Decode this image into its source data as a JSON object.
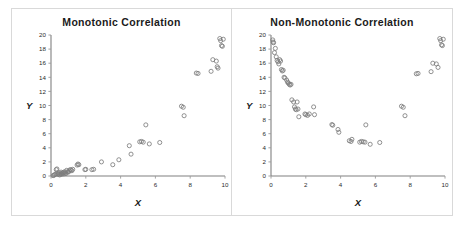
{
  "figure": {
    "background_color": "#ffffff",
    "frame_color": "#d9d9d9",
    "marker_color": "#7d7d7d",
    "axis_color": "#808080"
  },
  "panels": [
    {
      "id": "monotonic",
      "title": "Monotonic  Correlation",
      "xlabel": "X",
      "ylabel": "Y"
    },
    {
      "id": "non-monotonic",
      "title": "Non-Monotonic Correlation",
      "xlabel": "X",
      "ylabel": "Y"
    }
  ],
  "chart_data": [
    {
      "type": "scatter",
      "title": "Monotonic  Correlation",
      "xlabel": "X",
      "ylabel": "Y",
      "xlim": [
        0,
        10
      ],
      "ylim": [
        0,
        20
      ],
      "xticks": [
        0,
        2,
        4,
        6,
        8,
        10
      ],
      "yticks": [
        0,
        2,
        4,
        6,
        8,
        10,
        12,
        14,
        16,
        18,
        20
      ],
      "grid": false,
      "legend": "none",
      "marker": "open-circle",
      "series": [
        {
          "name": "points",
          "x": [
            0.12,
            0.18,
            0.22,
            0.28,
            0.3,
            0.34,
            0.38,
            0.42,
            0.46,
            0.5,
            0.55,
            0.58,
            0.62,
            0.66,
            0.7,
            0.74,
            0.78,
            0.82,
            0.86,
            0.9,
            0.95,
            1.0,
            1.05,
            1.1,
            1.15,
            1.2,
            1.25,
            1.5,
            1.55,
            1.6,
            1.95,
            2.0,
            2.35,
            2.45,
            2.9,
            3.55,
            3.9,
            4.5,
            4.6,
            5.1,
            5.2,
            5.3,
            5.65,
            6.25,
            5.45,
            7.5,
            7.6,
            7.65,
            8.35,
            8.45,
            9.2,
            9.3,
            9.5,
            9.55,
            9.6,
            9.7,
            9.75,
            9.8,
            9.85,
            9.9
          ],
          "y": [
            0.05,
            0.12,
            0.2,
            0.28,
            0.9,
            1.0,
            0.35,
            0.22,
            0.45,
            0.15,
            0.3,
            0.55,
            0.25,
            0.4,
            0.5,
            0.3,
            0.6,
            0.45,
            0.35,
            0.8,
            0.6,
            0.55,
            0.7,
            0.9,
            0.85,
            0.75,
            0.95,
            1.55,
            1.7,
            1.6,
            0.9,
            0.95,
            0.9,
            0.95,
            2.0,
            1.6,
            2.3,
            4.3,
            3.1,
            4.85,
            4.9,
            4.8,
            4.55,
            4.75,
            7.25,
            9.9,
            9.75,
            8.55,
            14.6,
            14.55,
            14.85,
            16.5,
            16.3,
            15.5,
            15.3,
            19.5,
            19.2,
            18.5,
            18.4,
            19.4
          ]
        }
      ]
    },
    {
      "type": "scatter",
      "title": "Non-Monotonic Correlation",
      "xlabel": "X",
      "ylabel": "Y",
      "xlim": [
        0,
        10
      ],
      "ylim": [
        0,
        20
      ],
      "xticks": [
        0,
        2,
        4,
        6,
        8,
        10
      ],
      "yticks": [
        0,
        2,
        4,
        6,
        8,
        10,
        12,
        14,
        16,
        18,
        20
      ],
      "grid": false,
      "legend": "none",
      "marker": "open-circle",
      "series": [
        {
          "name": "points",
          "x": [
            0.1,
            0.12,
            0.15,
            0.2,
            0.25,
            0.3,
            0.35,
            0.4,
            0.45,
            0.5,
            0.55,
            0.6,
            0.65,
            0.7,
            0.75,
            0.8,
            0.9,
            0.95,
            1.0,
            1.05,
            1.1,
            1.15,
            1.2,
            1.3,
            1.35,
            1.4,
            1.45,
            1.5,
            1.55,
            1.6,
            1.95,
            2.0,
            2.1,
            2.2,
            2.45,
            2.5,
            3.5,
            3.55,
            3.85,
            3.9,
            4.5,
            4.6,
            4.65,
            5.1,
            5.2,
            5.3,
            5.4,
            5.45,
            5.7,
            6.25,
            7.5,
            7.6,
            7.7,
            8.35,
            8.45,
            9.2,
            9.3,
            9.5,
            9.6,
            9.7,
            9.75,
            9.8,
            9.85,
            9.9
          ],
          "y": [
            19.3,
            19.0,
            18.9,
            17.5,
            18.1,
            16.9,
            16.4,
            16.2,
            15.9,
            16.5,
            16.3,
            15.1,
            14.9,
            15.0,
            14.0,
            13.9,
            13.6,
            13.3,
            13.2,
            13.0,
            12.9,
            13.0,
            10.8,
            10.5,
            9.8,
            9.5,
            9.4,
            10.5,
            9.5,
            8.4,
            8.8,
            8.7,
            8.6,
            8.8,
            9.8,
            8.7,
            7.3,
            7.2,
            6.6,
            6.2,
            5.0,
            4.9,
            5.2,
            4.8,
            4.9,
            4.85,
            4.8,
            7.25,
            4.5,
            4.75,
            9.9,
            9.75,
            8.55,
            14.5,
            14.55,
            14.8,
            16.0,
            15.9,
            15.4,
            19.5,
            19.2,
            18.6,
            18.5,
            19.4
          ]
        }
      ]
    }
  ]
}
